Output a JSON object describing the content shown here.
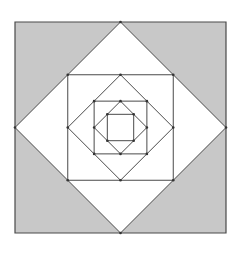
{
  "diagram": {
    "title": "",
    "nesting_levels": 7,
    "scale_ratio_per_level": 0.7071,
    "shapes": [
      {
        "level": 0,
        "kind": "square",
        "filled_corners": false
      },
      {
        "level": 1,
        "kind": "diamond"
      },
      {
        "level": 2,
        "kind": "square"
      },
      {
        "level": 3,
        "kind": "diamond"
      },
      {
        "level": 4,
        "kind": "square"
      },
      {
        "level": 5,
        "kind": "diamond"
      },
      {
        "level": 6,
        "kind": "square"
      }
    ],
    "colors": {
      "background": "#ffffff",
      "outer_corner_fill": "#c8c8c8",
      "inner_fill": "#ffffff",
      "stroke": "#4a4a4a",
      "vertex_dot": "#333333"
    },
    "show_vertex_dots": true
  }
}
